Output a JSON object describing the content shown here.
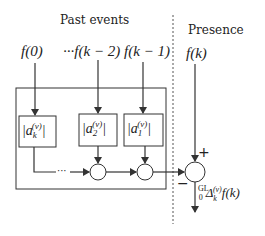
{
  "diagram": {
    "past_label": "Past events",
    "presence_label": "Presence",
    "inputs": {
      "f0": "f(0)",
      "fk2": "···f(k − 2)",
      "fk1": "f(k − 1)",
      "fk": "f(k)"
    },
    "coefficients": {
      "ak": {
        "base": "a",
        "sub": "k",
        "sup": "(v)"
      },
      "a2": {
        "base": "a",
        "sub": "2",
        "sup": "(v)"
      },
      "a1": {
        "base": "a",
        "sub": "1",
        "sup": "(v)"
      }
    },
    "ellipsis": "···",
    "plus_sign": "+",
    "minus_sign": "−",
    "output": {
      "prefix_sup": "GL",
      "prefix_sub": "0",
      "operator": "Δ",
      "op_sub": "k",
      "op_sup": "(v)",
      "arg": "f(k)"
    },
    "colors": {
      "stroke": "#333333",
      "text": "#222222",
      "divider": "#555555"
    }
  }
}
